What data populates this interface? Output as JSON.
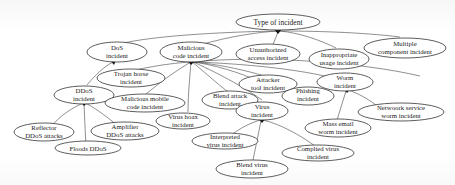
{
  "diagram": {
    "title": "Type of incident",
    "nodes": {
      "root": {
        "label": "Type of incident"
      },
      "dos": {
        "line1": "DoS",
        "line2": "incident"
      },
      "malicious": {
        "line1": "Malicious",
        "line2": "code incident"
      },
      "unauthorized": {
        "line1": "Unauthorized",
        "line2": "access incident"
      },
      "inappropriate": {
        "line1": "Inappropriate",
        "line2": "usage incident"
      },
      "multiple": {
        "line1": "Multiple",
        "line2": "component incident"
      },
      "trojan": {
        "line1": "Trojan horse",
        "line2": "incident"
      },
      "ddos": {
        "line1": "DDoS",
        "line2": "incident"
      },
      "mobile": {
        "line1": "Malicious mobile",
        "line2": "code incident"
      },
      "blend_attack": {
        "line1": "Blend attack",
        "line2": "incident"
      },
      "attacker_tool": {
        "line1": "Attacker",
        "line2": "tool incident"
      },
      "phishing": {
        "line1": "Phishing",
        "line2": "incident"
      },
      "worm": {
        "line1": "Worm",
        "line2": "incident"
      },
      "virus_hoax": {
        "line1": "Virus hoax",
        "line2": "incident"
      },
      "virus": {
        "line1": "Virus",
        "line2": "incident"
      },
      "network_worm": {
        "line1": "Netwoork service",
        "line2": "worm incident"
      },
      "reflector": {
        "line1": "Reflector",
        "line2": "DDoS attacks"
      },
      "amplifier": {
        "line1": "Amplifier",
        "line2": "DDoS attacks"
      },
      "floods": {
        "label": "Floods DDoS"
      },
      "interpreted": {
        "line1": "Interpreted",
        "line2": "virus incident"
      },
      "mass_email": {
        "line1": "Mass email",
        "line2": "worm incident"
      },
      "compiled": {
        "line1": "Complied virus",
        "line2": "incident"
      },
      "blend_virus": {
        "line1": "Blend virus",
        "line2": "incident"
      }
    },
    "edges": [
      [
        "dos",
        "root"
      ],
      [
        "malicious",
        "root"
      ],
      [
        "unauthorized",
        "root"
      ],
      [
        "inappropriate",
        "root"
      ],
      [
        "multiple",
        "root"
      ],
      [
        "ddos",
        "dos"
      ],
      [
        "trojan",
        "malicious"
      ],
      [
        "mobile",
        "malicious"
      ],
      [
        "blend_attack",
        "malicious"
      ],
      [
        "attacker_tool",
        "malicious"
      ],
      [
        "phishing",
        "malicious"
      ],
      [
        "worm",
        "malicious"
      ],
      [
        "virus_hoax",
        "malicious"
      ],
      [
        "virus",
        "malicious"
      ],
      [
        "reflector",
        "ddos"
      ],
      [
        "amplifier",
        "ddos"
      ],
      [
        "floods",
        "ddos"
      ],
      [
        "network_worm",
        "worm"
      ],
      [
        "mass_email",
        "worm"
      ],
      [
        "interpreted",
        "virus"
      ],
      [
        "compiled",
        "virus"
      ],
      [
        "blend_virus",
        "virus"
      ]
    ]
  }
}
